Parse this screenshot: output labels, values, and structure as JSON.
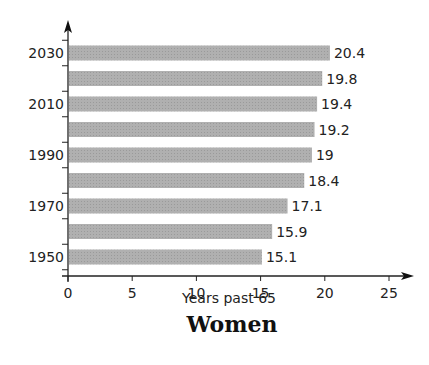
{
  "chart_data": {
    "type": "bar",
    "orientation": "horizontal",
    "title": "Women",
    "xlabel": "Years past 65",
    "ylabel": "",
    "categories": [
      "1950",
      "1960",
      "1970",
      "1980",
      "1990",
      "2000",
      "2010",
      "2020",
      "2030"
    ],
    "y_tick_labels": [
      "1950",
      "1970",
      "1990",
      "2010",
      "2030"
    ],
    "values": [
      15.1,
      15.9,
      17.1,
      18.4,
      19,
      19.2,
      19.4,
      19.8,
      20.4
    ],
    "value_labels": [
      "15.1",
      "15.9",
      "17.1",
      "18.4",
      "19",
      "19.2",
      "19.4",
      "19.8",
      "20.4"
    ],
    "x_ticks": [
      "0",
      "5",
      "10",
      "15",
      "20",
      "25"
    ],
    "xlim": [
      0,
      25
    ],
    "grid": false,
    "legend": null,
    "bar_color": "#a9a9a9"
  }
}
